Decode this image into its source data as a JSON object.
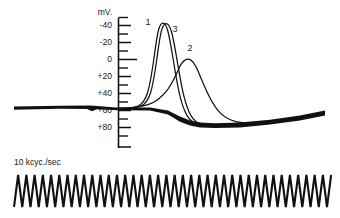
{
  "figure": {
    "title": "",
    "axis_unit_label": "mV.",
    "timebase_caption": "10 kcyc./sec",
    "ink_color": "#111111",
    "background_color": "#ffffff"
  },
  "y_axis": {
    "unit": "mV.",
    "tick_labels": [
      "-40",
      "-20",
      "0",
      "+20",
      "+40",
      "+60",
      "+80"
    ],
    "tick_values": [
      -40,
      -20,
      0,
      20,
      40,
      60,
      80
    ],
    "minor_tick_values": [
      -50,
      -30,
      -10,
      10,
      30,
      50,
      70
    ],
    "range": [
      -50,
      85
    ],
    "zero_tick_emphasized": true
  },
  "curve_labels": [
    {
      "name": "1",
      "x": 146,
      "y": 23
    },
    {
      "name": "3",
      "x": 172,
      "y": 30
    },
    {
      "name": "2",
      "x": 188,
      "y": 64
    }
  ],
  "chart_data": {
    "type": "line",
    "title": "",
    "subtitle": "",
    "xlabel": "",
    "ylabel": "mV.",
    "ylim": [
      85,
      -50
    ],
    "y_inverted": true,
    "grid": false,
    "legend": "inline-labels",
    "axis_unit": "mV.",
    "tick_labels": [
      "-40",
      "-20",
      "0",
      "+20",
      "+40",
      "+60",
      "+80"
    ],
    "tick_values": [
      -40,
      -20,
      0,
      20,
      40,
      60,
      80
    ],
    "resting_potential": 50,
    "series": [
      {
        "name": "1",
        "label": "1",
        "peak_mv": -41,
        "description": "earliest and tallest spike",
        "points": [
          [
            0,
            50
          ],
          [
            10,
            50
          ],
          [
            18,
            50
          ],
          [
            24,
            49.5
          ],
          [
            28,
            48
          ],
          [
            31,
            44
          ],
          [
            33,
            38
          ],
          [
            35,
            28
          ],
          [
            37,
            14
          ],
          [
            39,
            -2
          ],
          [
            41,
            -18
          ],
          [
            43,
            -31
          ],
          [
            45,
            -38
          ],
          [
            47,
            -41
          ],
          [
            49,
            -40
          ],
          [
            51,
            -34
          ],
          [
            53,
            -24
          ],
          [
            55,
            -11
          ],
          [
            57,
            3
          ],
          [
            59,
            17
          ],
          [
            61,
            29
          ],
          [
            63,
            40
          ],
          [
            65,
            50
          ],
          [
            68,
            58
          ],
          [
            71,
            65
          ],
          [
            74,
            70
          ],
          [
            78,
            73
          ],
          [
            83,
            75
          ],
          [
            90,
            75
          ],
          [
            100,
            74
          ]
        ]
      },
      {
        "name": "3",
        "label": "3",
        "peak_mv": -40,
        "description": "slightly delayed spike, nearly superimposed on 1",
        "points": [
          [
            0,
            50
          ],
          [
            10,
            50
          ],
          [
            20,
            50
          ],
          [
            26,
            49.5
          ],
          [
            30,
            48
          ],
          [
            34,
            44
          ],
          [
            36,
            38
          ],
          [
            38,
            28
          ],
          [
            40,
            14
          ],
          [
            42,
            -2
          ],
          [
            44,
            -18
          ],
          [
            46,
            -31
          ],
          [
            48,
            -38
          ],
          [
            50,
            -40
          ],
          [
            52,
            -39
          ],
          [
            54,
            -33
          ],
          [
            56,
            -23
          ],
          [
            58,
            -10
          ],
          [
            60,
            4
          ],
          [
            62,
            18
          ],
          [
            64,
            30
          ],
          [
            66,
            41
          ],
          [
            68,
            51
          ],
          [
            71,
            59
          ],
          [
            74,
            66
          ],
          [
            77,
            71
          ],
          [
            81,
            74
          ],
          [
            86,
            75
          ],
          [
            93,
            75
          ],
          [
            100,
            74
          ]
        ]
      },
      {
        "name": "2",
        "label": "2",
        "peak_mv": 0,
        "description": "slow low-amplitude response peaking at 0 mV",
        "points": [
          [
            0,
            50
          ],
          [
            10,
            50
          ],
          [
            18,
            50
          ],
          [
            24,
            49
          ],
          [
            30,
            47
          ],
          [
            36,
            44
          ],
          [
            42,
            40
          ],
          [
            48,
            34
          ],
          [
            54,
            27
          ],
          [
            60,
            19
          ],
          [
            66,
            11
          ],
          [
            70,
            5
          ],
          [
            74,
            1
          ],
          [
            77,
            0
          ],
          [
            80,
            1
          ],
          [
            84,
            6
          ],
          [
            88,
            15
          ],
          [
            92,
            27
          ],
          [
            96,
            40
          ],
          [
            100,
            52
          ],
          [
            104,
            62
          ],
          [
            108,
            69
          ],
          [
            112,
            73
          ],
          [
            117,
            75
          ],
          [
            124,
            75
          ]
        ]
      }
    ],
    "baseline_trace": {
      "name": "baseline",
      "description": "thick dark sweep trace at resting level, left portion flat then after spike dips and rises",
      "resting_mv": 50,
      "trough_mv": 75,
      "right_end_mv": 62
    },
    "timebase": {
      "type": "sine",
      "label": "10 kcyc./sec",
      "frequency_khz": 10,
      "cycles_visible": 38
    }
  }
}
